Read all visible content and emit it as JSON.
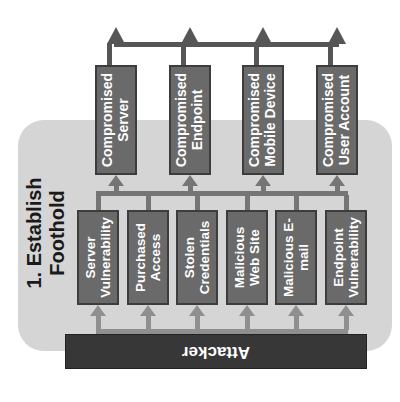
{
  "phase": {
    "title": "1. Establish Foothold"
  },
  "attacker": {
    "label": "Attacker"
  },
  "methods": [
    "Server Vulnerability",
    "Purchased Access",
    "Stolen Credentials",
    "Malicious Web Site",
    "Malicious E-mail",
    "Endpoint Vulnerability"
  ],
  "outcomes": [
    "Compromised Server",
    "Compromised Endpoint",
    "Compromised Mobile Device",
    "Compromised User Account"
  ],
  "flow": {
    "attacker_to": "all six method boxes",
    "methods_to": "all four compromised outcome boxes via shared bus",
    "outcomes_to": "arrows exiting the diagram toward next phase"
  },
  "colors": {
    "panel_background": "#d5d5d5",
    "box_fill": "#6a6a6a",
    "box_border": "#3d3d3d",
    "box_text": "#ffffff",
    "attacker_fill": "#373737",
    "arrow_light": "#8f8f8f",
    "arrow_mid": "#757575",
    "arrow_dark": "#565656",
    "title_text": "#1a1a1a"
  },
  "orientation_note": "entire diagram rotated 90 degrees counter-clockwise"
}
